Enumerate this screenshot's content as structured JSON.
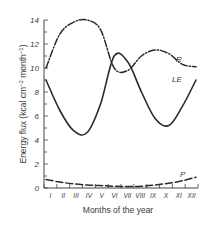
{
  "chart_data": {
    "type": "line",
    "title": "",
    "xlabel": "Months of the year",
    "ylabel": "Energy flux (kcal cm⁻² month⁻¹)",
    "ylim": [
      0,
      14
    ],
    "yticks": [
      0,
      2,
      4,
      6,
      8,
      10,
      12,
      14
    ],
    "grid": false,
    "legend": "inline labels at right",
    "categories": [
      "I",
      "II",
      "III",
      "IV",
      "V",
      "VI",
      "VII",
      "VIII",
      "IX",
      "X",
      "XI",
      "XII"
    ],
    "series": [
      {
        "name": "R",
        "style": "dash-dot",
        "values": [
          10.0,
          12.8,
          13.8,
          14.0,
          13.2,
          10.0,
          9.8,
          11.0,
          11.5,
          11.2,
          10.3,
          10.1
        ]
      },
      {
        "name": "LE",
        "style": "solid",
        "values": [
          9.0,
          6.5,
          4.8,
          4.6,
          7.0,
          11.0,
          10.5,
          8.0,
          5.8,
          5.2,
          6.8,
          9.0
        ]
      },
      {
        "name": "P",
        "style": "dashed",
        "values": [
          0.7,
          0.5,
          0.35,
          0.25,
          0.2,
          0.15,
          0.12,
          0.15,
          0.25,
          0.4,
          0.6,
          0.9
        ]
      }
    ]
  },
  "labels": {
    "xlabel": "Months of the year",
    "ylabel_main": "Energy flux (kcal cm",
    "ylabel_sup1": "−2",
    "ylabel_mid": " month",
    "ylabel_sup2": "−1",
    "ylabel_end": ")",
    "series_R": "R",
    "series_LE": "LE",
    "series_P": "P"
  }
}
